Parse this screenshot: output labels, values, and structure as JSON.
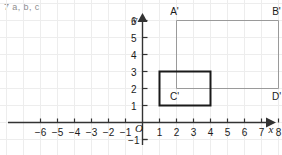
{
  "header": {
    "label": "7  a, b, c"
  },
  "chart_data": {
    "type": "scatter",
    "title": "",
    "xlabel": "x",
    "ylabel": "y",
    "grid": true,
    "legend": false,
    "xlim": [
      -7,
      9
    ],
    "ylim": [
      -1.6,
      7
    ],
    "xticks": [
      -6,
      -5,
      -4,
      -3,
      -2,
      -1,
      1,
      2,
      3,
      4,
      5,
      6,
      7,
      8
    ],
    "yticks": [
      -1,
      1,
      2,
      3,
      4,
      5,
      6
    ],
    "xtick_labels": [
      "−6",
      "−5",
      "−4",
      "−3",
      "−2",
      "−1",
      "1",
      "2",
      "3",
      "4",
      "5",
      "6",
      "7",
      "8"
    ],
    "ytick_labels": [
      "−1",
      "1",
      "2",
      "3",
      "4",
      "5",
      "6"
    ],
    "origin_label": "O",
    "shapes": [
      {
        "name": "image-rectangle",
        "style": "outline",
        "stroke": "#9a9a9a",
        "stroke_width": 1,
        "points": [
          [
            2,
            6
          ],
          [
            8,
            6
          ],
          [
            8,
            2
          ],
          [
            2,
            2
          ]
        ],
        "vertex_labels": [
          "A'",
          "B'",
          "D'",
          "C'"
        ]
      },
      {
        "name": "preimage-rectangle",
        "style": "outline",
        "stroke": "#1a1a1a",
        "stroke_width": 2,
        "points": [
          [
            1,
            3
          ],
          [
            4,
            3
          ],
          [
            4,
            1
          ],
          [
            1,
            1
          ]
        ],
        "vertex_labels": [
          "",
          "",
          "",
          ""
        ]
      }
    ],
    "annotations": [
      {
        "text": "A'",
        "x": 2,
        "y": 6,
        "dx": -2,
        "dy": -6
      },
      {
        "text": "B'",
        "x": 8,
        "y": 6,
        "dx": -2,
        "dy": -6
      },
      {
        "text": "C'",
        "x": 2,
        "y": 2,
        "dx": -2,
        "dy": 11
      },
      {
        "text": "D'",
        "x": 8,
        "y": 2,
        "dx": -2,
        "dy": 11
      }
    ]
  },
  "colors": {
    "grid": "#ededed",
    "axis": "#333333",
    "image_stroke": "#9a9a9a",
    "preimage_stroke": "#1a1a1a",
    "header_text": "#8e8e8e",
    "tick_text": "#1a1a1a",
    "background": "#ffffff"
  }
}
